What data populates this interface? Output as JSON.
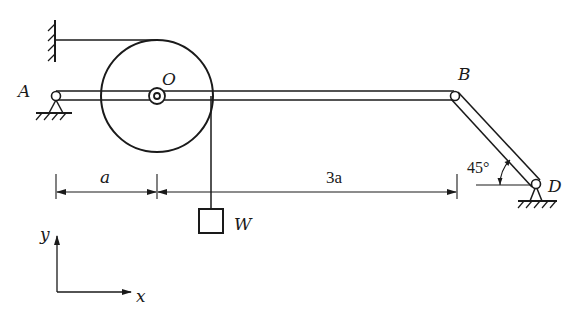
{
  "diagram": {
    "type": "statics-mechanism",
    "stroke_color": "#1a1a1a",
    "background": "#ffffff",
    "labels": {
      "A": "A",
      "O": "O",
      "B": "B",
      "D": "D",
      "W": "W",
      "y_axis": "y",
      "x_axis": "x"
    },
    "dimensions": {
      "left_span": "a",
      "right_span": "3a"
    },
    "angle": {
      "value": "45°",
      "location": "at D between bar BD and horizontal"
    },
    "components": [
      {
        "id": "wall-support",
        "description": "fixed wall at top-left with horizontal rope to top of pulley"
      },
      {
        "id": "pulley",
        "description": "circular pulley centered at O on beam AB"
      },
      {
        "id": "beam-AB",
        "description": "horizontal beam from pin A to pin B"
      },
      {
        "id": "bar-BD",
        "description": "inclined bar from B down to pin support D at 45°"
      },
      {
        "id": "weight-W",
        "description": "block W hanging by vertical rope from right side of pulley"
      },
      {
        "id": "pin-A",
        "description": "pin support at A"
      },
      {
        "id": "pin-D",
        "description": "pin support at D"
      },
      {
        "id": "axes",
        "description": "xy coordinate axes bottom-left"
      }
    ]
  }
}
